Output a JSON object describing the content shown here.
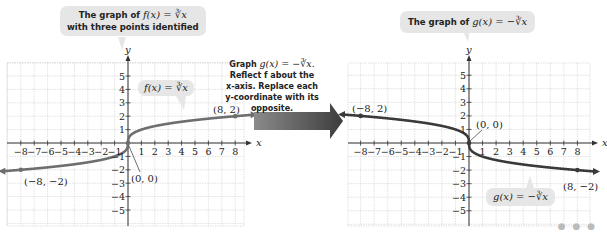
{
  "left_graph": {
    "callout_title": "The graph of f(x) = ∛x with three points identified",
    "callout_line1_prefix": "The graph of ",
    "callout_line1_math": "f(x) = ∛x",
    "callout_line2": "with three points identified",
    "curve_label": "f(x) = ∛x",
    "points": [
      {
        "label": "(−8, −2)",
        "x": -8,
        "y": -2
      },
      {
        "label": "(0, 0)",
        "x": 0,
        "y": 0
      },
      {
        "label": "(8, 2)",
        "x": 8,
        "y": 2
      }
    ]
  },
  "instruction": {
    "line1_prefix": "Graph ",
    "line1_math": "g(x) = −∛x.",
    "line2": "Reflect f about the",
    "line3": "x-axis. Replace each",
    "line4": "y-coordinate with its",
    "line5": "opposite."
  },
  "right_graph": {
    "callout_prefix": "The graph of ",
    "callout_math": "g(x) = −∛x",
    "curve_label": "g(x) = −∛x",
    "points": [
      {
        "label": "(−8, 2)",
        "x": -8,
        "y": 2
      },
      {
        "label": "(0, 0)",
        "x": 0,
        "y": 0
      },
      {
        "label": "(8, −2)",
        "x": 8,
        "y": -2
      }
    ]
  },
  "axes": {
    "x_label": "x",
    "y_label": "y",
    "x_ticks": [
      "−8",
      "−7",
      "−6",
      "−5",
      "−4",
      "−3",
      "−2",
      "−1",
      "1",
      "2",
      "3",
      "4",
      "5",
      "6",
      "7",
      "8"
    ],
    "y_ticks": [
      "5",
      "4",
      "3",
      "2",
      "1",
      "−1",
      "−2",
      "−3",
      "−4",
      "−5"
    ]
  },
  "colors": {
    "grid": "#cfcfcf",
    "curve_f": "#6e6e6e",
    "curve_g": "#3a3a3a",
    "arrow": "#555555",
    "callout_bg": "#e6e6e6"
  },
  "footer": {
    "more": "● ● ●"
  }
}
